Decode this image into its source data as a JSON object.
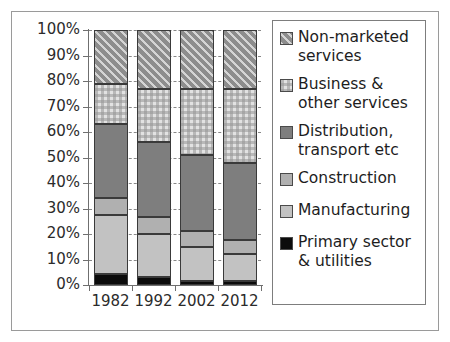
{
  "chart_data": {
    "type": "bar",
    "subtype": "stacked-percentage",
    "title": "",
    "subtitle": "",
    "xlabel": "",
    "ylabel": "",
    "categories": [
      "1982",
      "1992",
      "2002",
      "2012"
    ],
    "ylim": [
      0,
      100
    ],
    "y_unit": "%",
    "y_tick_labels": [
      "100%",
      "90%",
      "80%",
      "70%",
      "60%",
      "50%",
      "40%",
      "30%",
      "20%",
      "10%",
      "0%"
    ],
    "y_tick_values": [
      100,
      90,
      80,
      70,
      60,
      50,
      40,
      30,
      20,
      10,
      0
    ],
    "grid": "horizontal-dashed",
    "legend_position": "right",
    "stack_order_bottom_to_top": [
      "Primary sector & utilities",
      "Manufacturing",
      "Construction",
      "Distribution, transport etc",
      "Business & other services",
      "Non-marketed services"
    ],
    "series": [
      {
        "name": "Primary sector & utilities",
        "color": "#0c0c0c",
        "pattern": "solid",
        "values": [
          4.5,
          3.0,
          1.5,
          1.5
        ]
      },
      {
        "name": "Manufacturing",
        "color": "#c2c2c2",
        "pattern": "solid",
        "values": [
          23.0,
          17.0,
          13.5,
          10.5
        ]
      },
      {
        "name": "Construction",
        "color": "#b0b0b0",
        "pattern": "solid",
        "values": [
          6.5,
          6.5,
          6.0,
          5.5
        ]
      },
      {
        "name": "Distribution, transport etc",
        "color": "#7e7e7e",
        "pattern": "solid",
        "values": [
          29.0,
          29.5,
          30.0,
          30.5
        ]
      },
      {
        "name": "Business & other services",
        "color": "#e2e2e2",
        "pattern": "checkered",
        "values": [
          16.0,
          21.0,
          26.0,
          29.0
        ]
      },
      {
        "name": "Non-marketed services",
        "color": "#8d8d8d",
        "pattern": "diagonal-hatch",
        "values": [
          21.0,
          23.0,
          23.0,
          23.0
        ]
      }
    ],
    "cumulative_tops": {
      "1982": [
        4.5,
        27.5,
        34.0,
        63.0,
        79.0,
        100.0
      ],
      "1992": [
        3.0,
        20.0,
        26.5,
        56.0,
        77.0,
        100.0
      ],
      "2002": [
        1.5,
        15.0,
        21.0,
        51.0,
        77.0,
        100.0
      ],
      "2012": [
        1.5,
        12.0,
        17.5,
        48.0,
        77.0,
        100.0
      ]
    }
  },
  "legend": {
    "items": [
      {
        "label": "Non-marketed\nservices",
        "swatch": "nonmarketed",
        "gap_after": "sm"
      },
      {
        "label": "Business &\nother services",
        "swatch": "business",
        "gap_after": "sm"
      },
      {
        "label": "Distribution,\ntransport etc",
        "swatch": "distribution",
        "gap_after": "sm"
      },
      {
        "label": "Construction",
        "swatch": "construction",
        "gap_after": "md"
      },
      {
        "label": "Manufacturing",
        "swatch": "manufacturing",
        "gap_after": "md"
      },
      {
        "label": "Primary sector\n& utilities",
        "swatch": "primary",
        "gap_after": "none"
      }
    ]
  },
  "axes": {
    "y_labels": [
      "100%",
      "90%",
      "80%",
      "70%",
      "60%",
      "50%",
      "40%",
      "30%",
      "20%",
      "10%",
      "0%"
    ],
    "x_labels": [
      "1982",
      "1992",
      "2002",
      "2012"
    ]
  }
}
